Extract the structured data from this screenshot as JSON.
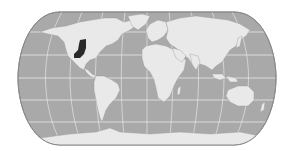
{
  "map": {
    "type": "world-map",
    "projection": "pseudo-cylindrical (rounded sides, flat poles)",
    "style": "grayscale",
    "colors": {
      "background": "#ffffff",
      "ocean": "#a9a9a9",
      "land": "#e9e9e9",
      "graticule": "#f2f2f2",
      "outline": "#8a8a8a",
      "highlight": "#2a2a2a"
    },
    "highlighted_regions": [
      {
        "name": "central-north-america-great-plains",
        "description": "dark shaded area in the central United States"
      }
    ],
    "graticule": {
      "parallels": true,
      "meridians": true
    }
  }
}
